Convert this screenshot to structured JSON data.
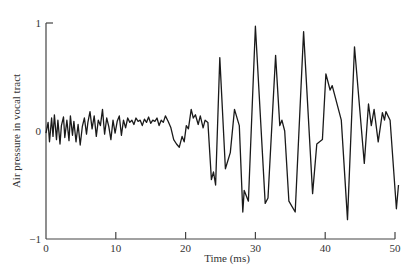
{
  "chart_data": {
    "type": "line",
    "title": "",
    "xlabel": "Time (ms)",
    "ylabel": "Air pressure in vocal tract",
    "xlim": [
      0,
      50
    ],
    "ylim": [
      -1,
      1
    ],
    "x_ticks": [
      0,
      10,
      20,
      30,
      40,
      50
    ],
    "x_tick_labels": [
      "0",
      "10",
      "20",
      "30",
      "40",
      "50"
    ],
    "y_ticks": [
      1,
      0,
      -1
    ],
    "y_tick_labels": [
      "1",
      "0",
      "−1"
    ],
    "grid": false,
    "legend": null,
    "series": [
      {
        "name": "air pressure",
        "color": "#1a1a1a",
        "x": [
          0,
          0.3,
          0.5,
          0.8,
          1.0,
          1.2,
          1.5,
          1.7,
          2.0,
          2.2,
          2.5,
          2.7,
          3.0,
          3.3,
          3.5,
          3.8,
          4.0,
          4.3,
          4.6,
          4.9,
          5.2,
          5.5,
          5.8,
          6.0,
          6.3,
          6.6,
          6.9,
          7.2,
          7.5,
          7.8,
          8.1,
          8.4,
          8.7,
          9.0,
          9.3,
          9.6,
          9.9,
          10.2,
          10.5,
          10.8,
          11.1,
          11.4,
          11.7,
          12.0,
          12.3,
          12.6,
          12.9,
          13.2,
          13.5,
          13.8,
          14.1,
          14.4,
          14.7,
          15.0,
          15.3,
          15.6,
          15.9,
          16.2,
          16.5,
          16.8,
          17.1,
          17.5,
          17.9,
          18.3,
          18.7,
          19.1,
          19.5,
          19.8,
          20.1,
          20.4,
          20.8,
          21.1,
          21.4,
          21.8,
          22.1,
          22.5,
          22.8,
          23.2,
          23.7,
          24.0,
          24.3,
          24.9,
          25.7,
          26.4,
          27.0,
          27.7,
          28.2,
          28.4,
          29.0,
          30.0,
          31.4,
          31.8,
          32.9,
          33.5,
          33.8,
          34.2,
          34.8,
          35.7,
          36.9,
          38.2,
          38.8,
          39.6,
          40.1,
          40.7,
          41.0,
          42.3,
          43.2,
          44.2,
          45.6,
          46.2,
          46.6,
          47.0,
          47.6,
          48.2,
          48.5,
          48.7,
          49.3,
          50.2,
          50.5
        ],
        "values": [
          -0.02,
          0.08,
          -0.1,
          0.12,
          -0.05,
          0.15,
          -0.08,
          0.1,
          -0.12,
          0.05,
          0.13,
          -0.06,
          0.1,
          -0.09,
          0.14,
          -0.04,
          0.09,
          -0.1,
          0.06,
          -0.13,
          0.04,
          0.12,
          -0.03,
          0.08,
          0.18,
          0.02,
          0.14,
          -0.05,
          0.1,
          0.05,
          0.2,
          -0.03,
          0.12,
          0.04,
          -0.08,
          0.1,
          -0.02,
          0.09,
          0.14,
          -0.04,
          0.1,
          0.03,
          0.12,
          0.08,
          0.1,
          0.06,
          0.12,
          0.09,
          0.1,
          0.05,
          0.11,
          0.08,
          0.13,
          0.07,
          0.1,
          0.09,
          0.12,
          0.05,
          0.1,
          0.08,
          0.14,
          0.09,
          0.03,
          -0.08,
          -0.12,
          -0.15,
          -0.05,
          -0.1,
          0.05,
          0.02,
          0.2,
          0.12,
          0.15,
          0.06,
          0.14,
          0.03,
          0.1,
          0.08,
          -0.45,
          -0.38,
          -0.5,
          0.68,
          -0.35,
          -0.2,
          0.2,
          0.05,
          -0.75,
          -0.55,
          -0.65,
          0.97,
          -0.67,
          -0.62,
          0.7,
          0.05,
          0.1,
          0.0,
          -0.65,
          -0.75,
          0.92,
          -0.58,
          -0.12,
          -0.08,
          0.53,
          0.38,
          0.42,
          0.1,
          -0.82,
          0.78,
          -0.3,
          0.25,
          0.05,
          0.2,
          -0.1,
          0.17,
          0.1,
          0.18,
          0.1,
          -0.72,
          -0.5
        ]
      }
    ]
  }
}
